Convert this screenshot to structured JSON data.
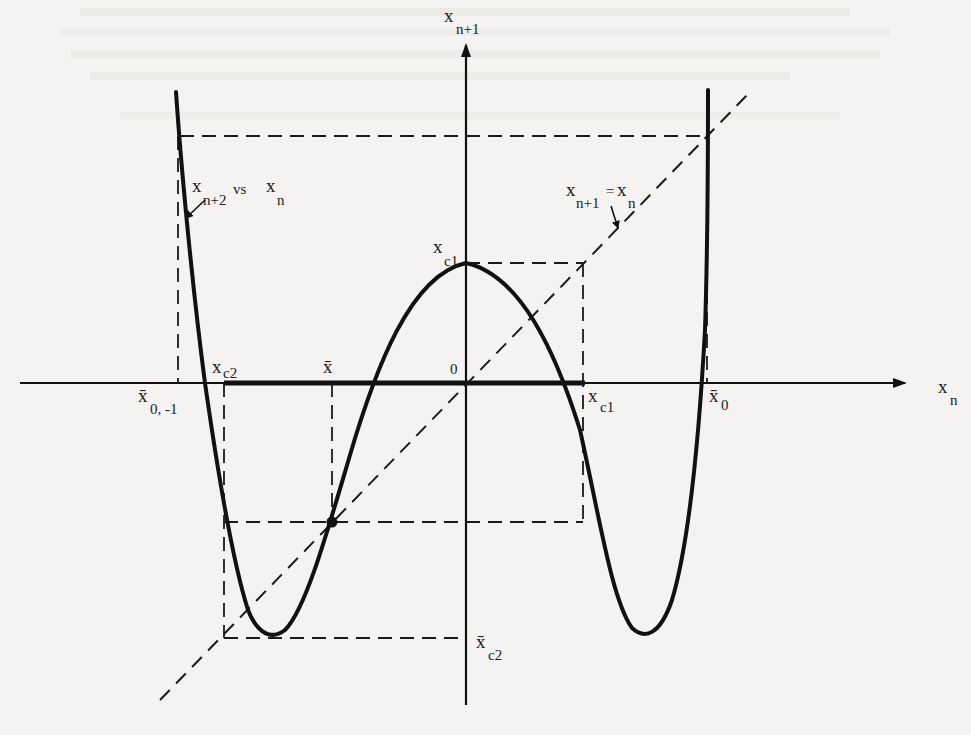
{
  "figure": {
    "axes": {
      "horizontal_label": {
        "main": "x",
        "sub": "n"
      },
      "vertical_label": {
        "main": "x",
        "sub": "n+1"
      },
      "origin_label": "0"
    },
    "curve_label": {
      "main": "x",
      "sub": "n+2",
      "rest": "vs",
      "rest_main": "x",
      "rest_sub": "n"
    },
    "diagonal_label": {
      "main": "x",
      "sub": "n+1",
      "eq": "=",
      "rhs_main": "x",
      "rhs_sub": "n"
    },
    "points": {
      "xc1_top": {
        "main": "x",
        "sub": "c1"
      },
      "xc1_axis": {
        "main": "x",
        "sub": "c1"
      },
      "xc2_axis": {
        "main": "x",
        "sub": "c2"
      },
      "xbar": {
        "main": "x̄",
        "sub": ""
      },
      "xbar0": {
        "main": "x̄",
        "sub": "0"
      },
      "xbar0_minus1": {
        "main": "x̄",
        "sub": "0, -1"
      },
      "xbar_c2": {
        "main": "x̄",
        "sub": "c2"
      }
    },
    "colors": {
      "background": "#f4f3f1",
      "ink": "#111111"
    }
  }
}
